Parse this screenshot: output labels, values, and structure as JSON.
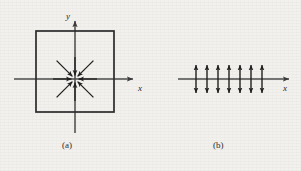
{
  "figure": {
    "background_color": "#f2f1ee",
    "ink_color": "#2b2b2b",
    "panels": [
      {
        "id": "a",
        "caption": "(a)",
        "kind": "vector-field-2d",
        "axes": {
          "x_label": "x",
          "y_label": "y",
          "origin": [
            75,
            79
          ],
          "x_axis_span": [
            14,
            135
          ],
          "y_axis_span": [
            19,
            133
          ],
          "x_arrow_at_end": true,
          "y_arrow_at_end": true
        },
        "boundary": {
          "shape": "square",
          "left": 36,
          "top": 31,
          "right": 114,
          "bottom": 112,
          "stroke_width": 1.6
        },
        "field_arrows": {
          "count": 8,
          "direction": "inward",
          "description": "eight arrows converging toward the origin from all eight compass directions",
          "tail_radius_axial": 22,
          "tail_radius_diagonal": 26,
          "head_radius": 3
        }
      },
      {
        "id": "b",
        "caption": "(b)",
        "kind": "vector-field-1d",
        "axes": {
          "x_label": "x",
          "axis_y": 79,
          "x_axis_span": [
            178,
            291
          ],
          "x_arrow_at_end": true
        },
        "field_arrows": {
          "pairs": 7,
          "direction": "outward",
          "description": "seven pairs of vertical arrows pointing away from the axis, up and down",
          "first_x": 196,
          "spacing": 11,
          "arm_length": 16
        }
      }
    ]
  }
}
